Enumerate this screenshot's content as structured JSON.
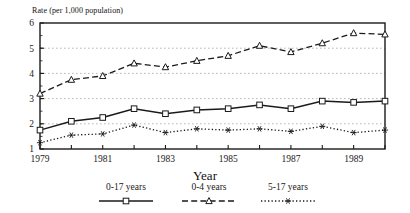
{
  "chart_data": {
    "type": "line",
    "title": "",
    "ylabel": "Rate (per 1,000 population)",
    "xlabel": "Year",
    "ylim": [
      1,
      6
    ],
    "xlim": [
      1979,
      1990
    ],
    "yticks": [
      "1",
      "2",
      "3",
      "4",
      "5",
      "6"
    ],
    "ytick_values": [
      1,
      2,
      3,
      4,
      5,
      6
    ],
    "xticks_all": [
      1979,
      1980,
      1981,
      1982,
      1983,
      1984,
      1985,
      1986,
      1987,
      1988,
      1989,
      1990
    ],
    "xtick_labels": [
      "1979",
      "",
      "1981",
      "",
      "1983",
      "",
      "1985",
      "",
      "1987",
      "",
      "1989",
      ""
    ],
    "grid": "horizontal-dotted",
    "legend_position": "below",
    "x": [
      1979,
      1980,
      1981,
      1982,
      1983,
      1984,
      1985,
      1986,
      1987,
      1988,
      1989,
      1990
    ],
    "series": [
      {
        "name": "0-17 years",
        "marker": "square",
        "linestyle": "solid",
        "color": "#1a1a1a",
        "values": [
          1.75,
          2.1,
          2.25,
          2.6,
          2.4,
          2.55,
          2.6,
          2.75,
          2.6,
          2.9,
          2.85,
          2.9
        ]
      },
      {
        "name": "0-4 years",
        "marker": "triangle",
        "linestyle": "dashed",
        "color": "#1a1a1a",
        "values": [
          3.2,
          3.75,
          3.9,
          4.4,
          4.25,
          4.5,
          4.7,
          5.1,
          4.85,
          5.2,
          5.6,
          5.55
        ]
      },
      {
        "name": "5-17 years",
        "marker": "star",
        "linestyle": "dotted",
        "color": "#1a1a1a",
        "values": [
          1.25,
          1.55,
          1.6,
          1.95,
          1.65,
          1.8,
          1.75,
          1.8,
          1.7,
          1.9,
          1.65,
          1.75
        ]
      }
    ]
  },
  "legend": {
    "items": [
      {
        "label": "0-17 years"
      },
      {
        "label": "0-4 years"
      },
      {
        "label": "5-17 years"
      }
    ]
  },
  "axes": {
    "y_title": "Rate (per 1,000 population)",
    "x_title": "Year"
  }
}
